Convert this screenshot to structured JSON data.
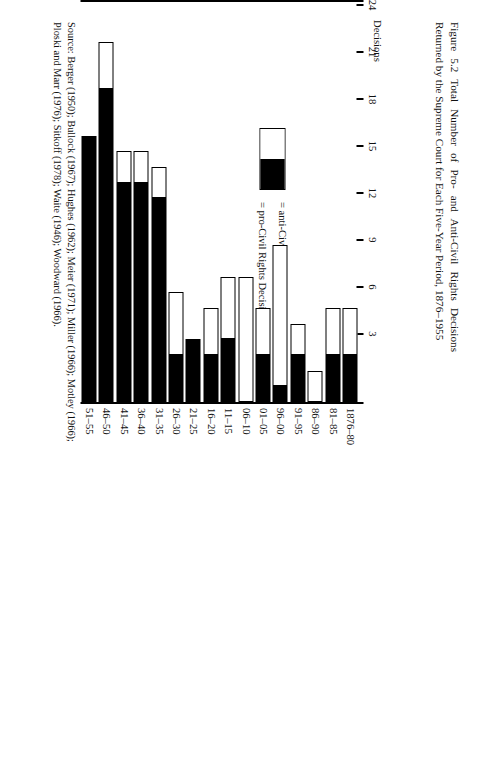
{
  "caption": {
    "figure_number": "Figure 5.2",
    "text": "Figure 5.2   Total Number of Pro- and Anti-Civil Rights Decisions Returned by the Supreme Court for Each Five-Year Period, 1876–1955"
  },
  "source": {
    "text": "Source: Berger (1950); Bullock (1967); Hughes (1962); Meier (1971); Miller (1966); Motley (1966); Ploski and Marr (1976); Sitkoff (1978); Waite (1946); Woodward (1966)."
  },
  "legend": {
    "swatch_name": "legend-swatch",
    "anti_label": "=  anti-Civil Rights Decisions",
    "pro_label": "=  pro-Civil Rights Decisions",
    "anti_color": "#ffffff",
    "pro_color": "#000000"
  },
  "axis": {
    "title": "Decisions",
    "ticks": [
      "24",
      "21",
      "18",
      "15",
      "12",
      "9",
      "6",
      "3"
    ],
    "tick_values": [
      24,
      21,
      18,
      15,
      12,
      9,
      6,
      3
    ]
  },
  "chart_data": {
    "type": "bar",
    "title": "Figure 5.2   Total Number of Pro- and Anti-Civil Rights Decisions Returned by the Supreme Court for Each Five-Year Period, 1876–1955",
    "orientation": "horizontal-stacked",
    "xlabel": "",
    "ylabel": "Decisions",
    "ylim": [
      0,
      24
    ],
    "grid": false,
    "legend_position": "inside-left",
    "categories": [
      "1876–80",
      "81–85",
      "86–90",
      "91–95",
      "96–00",
      "01–05",
      "06–10",
      "11–15",
      "16–20",
      "21–25",
      "26–30",
      "31–35",
      "36–40",
      "41–45",
      "46–50",
      "51–55"
    ],
    "series": [
      {
        "name": "pro-Civil Rights Decisions",
        "color": "#000000",
        "values": [
          3,
          3,
          0,
          3,
          1,
          3,
          0,
          4,
          3,
          4,
          3,
          13,
          14,
          14,
          20,
          17
        ]
      },
      {
        "name": "anti-Civil Rights Decisions",
        "color": "#ffffff",
        "values": [
          3,
          3,
          2,
          2,
          9,
          3,
          8,
          4,
          3,
          0,
          4,
          2,
          2,
          2,
          3,
          0
        ]
      }
    ],
    "totals": [
      6,
      6,
      2,
      5,
      10,
      6,
      8,
      8,
      6,
      4,
      7,
      15,
      16,
      16,
      23,
      17
    ]
  }
}
